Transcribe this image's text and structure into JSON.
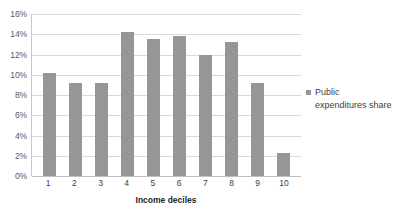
{
  "chart_data": {
    "type": "bar",
    "title": "",
    "subtitle": "",
    "xlabel": "Income deciles",
    "ylabel": "",
    "categories": [
      "1",
      "2",
      "3",
      "4",
      "5",
      "6",
      "7",
      "8",
      "9",
      "10"
    ],
    "values": [
      10.2,
      9.2,
      9.2,
      14.2,
      13.5,
      13.8,
      12.0,
      13.2,
      9.2,
      2.3
    ],
    "series": [
      {
        "name": "Public expenditures share",
        "values": [
          10.2,
          9.2,
          9.2,
          14.2,
          13.5,
          13.8,
          12.0,
          13.2,
          9.2,
          2.3
        ]
      }
    ],
    "ylim": [
      0,
      16
    ],
    "ytick_values": [
      0,
      2,
      4,
      6,
      8,
      10,
      12,
      14,
      16
    ],
    "ytick_labels": [
      "0%",
      "2%",
      "4%",
      "6%",
      "8%",
      "10%",
      "12%",
      "14%",
      "16%"
    ],
    "grid": true,
    "grid_axis": "y",
    "legend": {
      "position": "right",
      "entries": [
        "Public expenditures share"
      ]
    },
    "bar_color": "#969696",
    "gridline_color": "#d9d9d9",
    "axis_color": "#bfbfbf",
    "background_color": "#ffffff"
  }
}
